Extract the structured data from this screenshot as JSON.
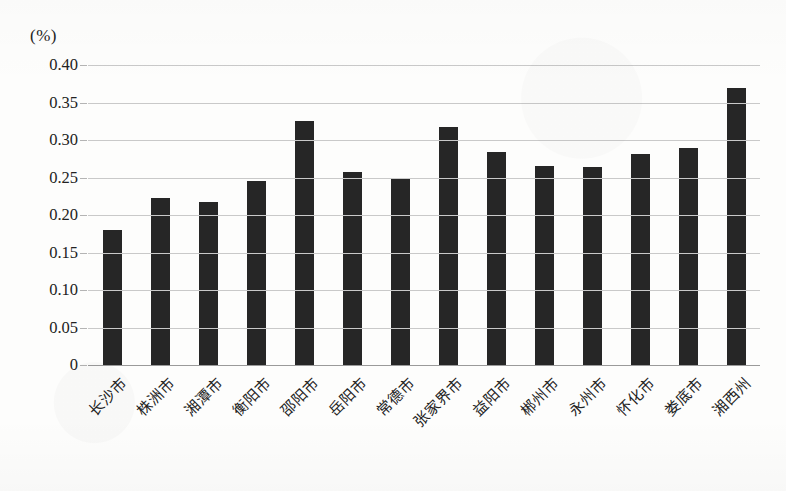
{
  "chart_data": {
    "type": "bar",
    "title": "",
    "subtitle": "",
    "xlabel": "",
    "ylabel": "(%)",
    "unit_label": "(%)",
    "categories": [
      "长沙市",
      "株洲市",
      "湘潭市",
      "衡阳市",
      "邵阳市",
      "岳阳市",
      "常德市",
      "张家界市",
      "益阳市",
      "郴州市",
      "永州市",
      "怀化市",
      "娄底市",
      "湘西州"
    ],
    "values": [
      0.18,
      0.223,
      0.217,
      0.245,
      0.325,
      0.257,
      0.25,
      0.318,
      0.284,
      0.266,
      0.264,
      0.281,
      0.289,
      0.37
    ],
    "ylim": [
      0,
      0.4
    ],
    "ytick_labels": [
      "0.40",
      "0.35",
      "0.30",
      "0.25",
      "0.20",
      "0.15",
      "0.10",
      "0.05",
      "0"
    ],
    "ytick_values": [
      0.4,
      0.35,
      0.3,
      0.25,
      0.2,
      0.15,
      0.1,
      0.05,
      0
    ],
    "grid": true,
    "legend": [],
    "legend_position": "none",
    "series": [
      {
        "name": "",
        "values": [
          0.18,
          0.223,
          0.217,
          0.245,
          0.325,
          0.257,
          0.25,
          0.318,
          0.284,
          0.266,
          0.264,
          0.281,
          0.289,
          0.37
        ]
      }
    ],
    "bar_color": "#262626",
    "gridline_color": "#c9c9c9",
    "background_color": "#fdfdfc"
  }
}
